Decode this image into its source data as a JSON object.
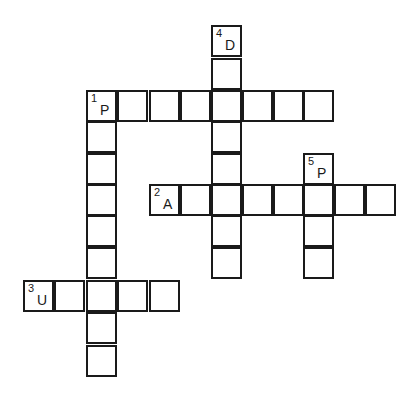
{
  "puzzle": {
    "type": "crossword",
    "cell_size": 31,
    "origin": {
      "x": 24,
      "y": 26
    },
    "entries": [
      {
        "number": "1",
        "direction": "across",
        "start_letter": "P",
        "row": 2,
        "col": 2,
        "length": 8
      },
      {
        "number": "1",
        "direction": "down",
        "start_letter": "P",
        "row": 2,
        "col": 2,
        "length": 9
      },
      {
        "number": "2",
        "direction": "across",
        "start_letter": "A",
        "row": 5,
        "col": 4,
        "length": 8
      },
      {
        "number": "3",
        "direction": "across",
        "start_letter": "U",
        "row": 8,
        "col": 0,
        "length": 5
      },
      {
        "number": "4",
        "direction": "down",
        "start_letter": "D",
        "row": 0,
        "col": 6,
        "length": 8
      },
      {
        "number": "5",
        "direction": "down",
        "start_letter": "P",
        "row": 4,
        "col": 9,
        "length": 4
      }
    ],
    "clue_cells": [
      {
        "number": "1",
        "letter": "P",
        "row": 2,
        "col": 2
      },
      {
        "number": "2",
        "letter": "A",
        "row": 5,
        "col": 4
      },
      {
        "number": "3",
        "letter": "U",
        "row": 8,
        "col": 0
      },
      {
        "number": "4",
        "letter": "D",
        "row": 0,
        "col": 6
      },
      {
        "number": "5",
        "letter": "P",
        "row": 4,
        "col": 9
      }
    ]
  }
}
